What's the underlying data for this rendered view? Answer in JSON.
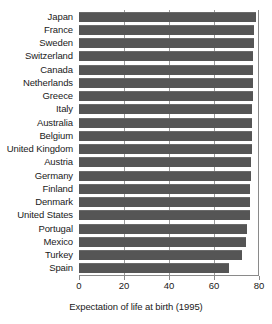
{
  "chart_data": {
    "type": "bar",
    "orientation": "horizontal",
    "title": "",
    "xlabel": "Expectation of life at birth (1995)",
    "ylabel": "",
    "xlim": [
      0,
      80
    ],
    "ylim": null,
    "grid": true,
    "legend": null,
    "xticks": [
      0,
      20,
      40,
      60,
      80
    ],
    "xtick_labels": [
      "0",
      "20",
      "40",
      "60",
      "80"
    ],
    "bar_color": "#555555",
    "categories": [
      "Japan",
      "France",
      "Sweden",
      "Switzerland",
      "Canada",
      "Netherlands",
      "Greece",
      "Italy",
      "Australia",
      "Belgium",
      "United Kingdom",
      "Austria",
      "Germany",
      "Finland",
      "Denmark",
      "United States",
      "Portugal",
      "Mexico",
      "Turkey",
      "Spain"
    ],
    "values": [
      78.5,
      77.8,
      77.6,
      77.5,
      77.4,
      77.3,
      77.2,
      77.1,
      77.0,
      76.9,
      76.7,
      76.5,
      76.4,
      76.2,
      76.0,
      75.8,
      74.5,
      74.0,
      72.5,
      66.5
    ]
  }
}
